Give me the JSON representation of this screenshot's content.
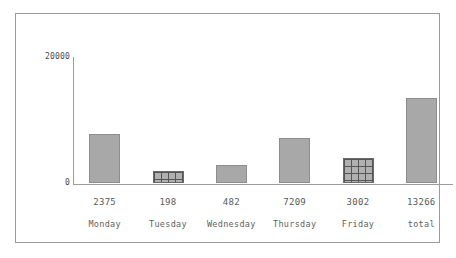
{
  "chart_data": {
    "type": "bar",
    "title": "",
    "subtitle": "",
    "xlabel": "",
    "ylabel": "",
    "categories": [
      "Monday",
      "Tuesday",
      "Wednesday",
      "Thursday",
      "Friday",
      "total"
    ],
    "values": [
      2375,
      198,
      482,
      7209,
      3002,
      13266
    ],
    "value_labels": [
      "2375",
      "198",
      "482",
      "7209",
      "3002",
      "13266"
    ],
    "bar_pixel_heights": [
      49,
      12,
      18,
      45,
      25,
      85
    ],
    "bar_styles": [
      "solid",
      "hatched",
      "solid",
      "solid",
      "hatched",
      "solid"
    ],
    "ylim": [
      0,
      20000
    ],
    "y_tick_labels": [
      "20000",
      "0"
    ],
    "y_ticks": [
      20000,
      0
    ],
    "grid": false,
    "legend": null,
    "legend_position": "none",
    "colors": {
      "bar_fill": "#a8a8a8",
      "bar_border": "#8d8d8d",
      "hatch_line": "#555555",
      "axis": "#9c9c9c",
      "frame": "#9a9a9a",
      "text": "#5a5a5a",
      "background": "#ffffff"
    }
  },
  "axis": {
    "top_tick": "20000",
    "bottom_tick": "0"
  },
  "bars": [
    {
      "category": "Monday",
      "value_label": "2375",
      "height_px": 49,
      "style": "solid"
    },
    {
      "category": "Tuesday",
      "value_label": "198",
      "height_px": 12,
      "style": "hatched"
    },
    {
      "category": "Wednesday",
      "value_label": "482",
      "height_px": 18,
      "style": "solid"
    },
    {
      "category": "Thursday",
      "value_label": "7209",
      "height_px": 45,
      "style": "solid"
    },
    {
      "category": "Friday",
      "value_label": "3002",
      "height_px": 25,
      "style": "hatched"
    },
    {
      "category": "total",
      "value_label": "13266",
      "height_px": 85,
      "style": "solid"
    }
  ]
}
